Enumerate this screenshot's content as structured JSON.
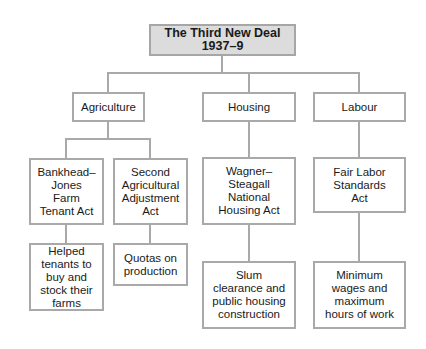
{
  "diagram": {
    "title": "The Third New Deal 1937–9",
    "categories": [
      {
        "label": "Agriculture"
      },
      {
        "label": "Housing"
      },
      {
        "label": "Labour"
      }
    ],
    "acts": [
      {
        "category": "Agriculture",
        "label": "Bankhead– Jones Farm Tenant Act",
        "outcome": "Helped tenants to buy and stock their farms"
      },
      {
        "category": "Agriculture",
        "label": "Second Agricultural Adjustment Act",
        "outcome": "Quotas on production"
      },
      {
        "category": "Housing",
        "label": "Wagner– Steagall National Housing Act",
        "outcome": "Slum clearance and public housing construction"
      },
      {
        "category": "Labour",
        "label": "Fair Labor Standards Act",
        "outcome": "Minimum wages and maximum hours of work"
      }
    ],
    "colors": {
      "border": "#a9a9a9",
      "title_fill": "#dcdcdc"
    }
  }
}
